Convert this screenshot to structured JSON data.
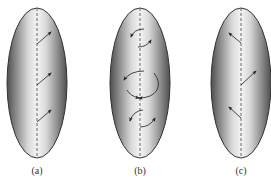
{
  "figure": {
    "colors": {
      "background": "#ffffff",
      "ellipse_edge": "#5a5a5a",
      "ellipse_mid": "#f2f2f2",
      "outline": "#333333",
      "axis": "#555555",
      "arrow": "#222222"
    },
    "panels": [
      {
        "id": "a",
        "label": "(a)",
        "cx": 37,
        "cy": 83,
        "rx": 30,
        "ry": 75,
        "arrows": [
          {
            "type": "straight",
            "from": [
              37,
              44
            ],
            "to": [
              51,
              32
            ]
          },
          {
            "type": "straight",
            "from": [
              37,
              85
            ],
            "to": [
              51,
              73
            ]
          },
          {
            "type": "straight",
            "from": [
              37,
              122
            ],
            "to": [
              51,
              110
            ]
          }
        ]
      },
      {
        "id": "b",
        "label": "(b)",
        "cx": 140,
        "cy": 83,
        "rx": 30,
        "ry": 75,
        "arrows": [
          {
            "type": "curved",
            "d": "M144,29 Q134,29 131,37"
          },
          {
            "type": "curved",
            "d": "M138,47 Q147,47 151,40"
          },
          {
            "type": "curved",
            "d": "M144,71 Q130,71 124,80"
          },
          {
            "type": "curved",
            "d": "M154,73 Q161,82 157,90 Q152,98 139,98"
          },
          {
            "type": "curved",
            "d": "M127,90 Q130,96 139,98"
          },
          {
            "type": "curved",
            "d": "M143,110 Q133,111 130,121"
          },
          {
            "type": "curved",
            "d": "M140,127 Q150,127 155,118"
          }
        ]
      },
      {
        "id": "c",
        "label": "(c)",
        "cx": 241,
        "cy": 83,
        "rx": 30,
        "ry": 75,
        "arrows": [
          {
            "type": "straight",
            "from": [
              241,
              43
            ],
            "to": [
              229,
              33
            ]
          },
          {
            "type": "straight",
            "from": [
              241,
              85
            ],
            "to": [
              256,
              71
            ]
          },
          {
            "type": "straight",
            "from": [
              241,
              118
            ],
            "to": [
              229,
              107
            ]
          }
        ]
      }
    ]
  }
}
